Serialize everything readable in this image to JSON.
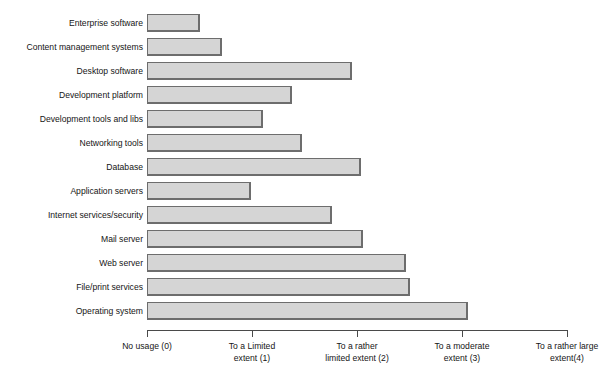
{
  "chart_data": {
    "type": "bar",
    "orientation": "horizontal",
    "title": "",
    "xlabel": "",
    "ylabel": "",
    "xlim": [
      0,
      4
    ],
    "grid": false,
    "legend": false,
    "bar_color": "#d5d5d5",
    "bar_border_color": "#6d6d6d",
    "axis_color": "#4a4a4a",
    "xticks": [
      0,
      1,
      2,
      3,
      4
    ],
    "xticklabels": [
      "No usage (0)",
      "To a Limited\nextent (1)",
      "To a rather\nlimited extent (2)",
      "To a moderate\nextent (3)",
      "To a rather large\nextent(4)"
    ],
    "categories": [
      "Enterprise software",
      "Content management systems",
      "Desktop software",
      "Development platform",
      "Development tools and libs",
      "Networking tools",
      "Database",
      "Application servers",
      "Internet services/security",
      "Mail server",
      "Web server",
      "File/print services",
      "Operating system"
    ],
    "values": [
      0.5,
      0.71,
      1.95,
      1.38,
      1.1,
      1.48,
      2.04,
      0.99,
      1.76,
      2.06,
      2.47,
      2.5,
      3.06
    ]
  },
  "title_remnant": " "
}
